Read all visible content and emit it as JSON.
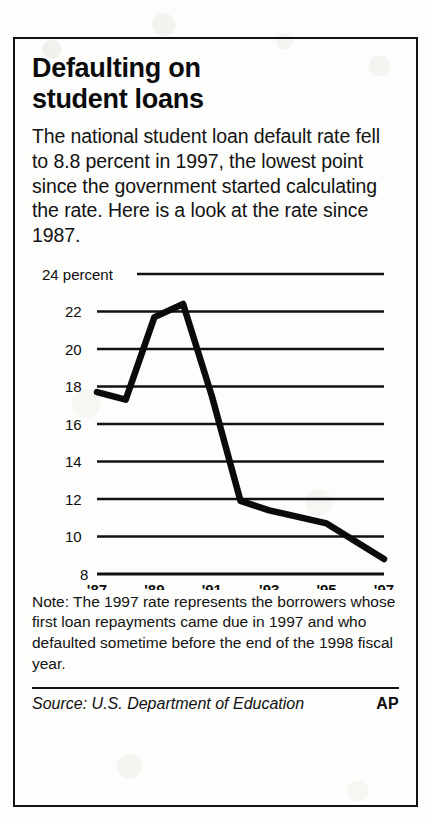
{
  "headline": {
    "line1": "Defaulting on",
    "line2": "student loans"
  },
  "deck": "The national student loan default rate fell to 8.8 percent in 1997, the lowest point since the government started calculating the rate. Here is a look at the rate since 1987.",
  "note": "Note: The 1997 rate represents the borrowers whose first loan repayments came due in 1997 and who defaulted sometime before the end of the 1998 fiscal year.",
  "source": {
    "text": "Source: U.S. Department of Education",
    "credit": "AP"
  },
  "colors": {
    "ink": "#111111",
    "line": "#0b0b0b",
    "paper": "#fdfdfb"
  },
  "chart_data": {
    "type": "line",
    "title": "Defaulting on student loans",
    "xlabel": "",
    "ylabel": "percent",
    "y_unit_label": "24 percent",
    "ylim": [
      8,
      24
    ],
    "yticks": [
      24,
      22,
      20,
      18,
      16,
      14,
      12,
      10,
      8
    ],
    "ytick_labels": [
      "24 percent",
      "22",
      "20",
      "18",
      "16",
      "14",
      "12",
      "10",
      "8"
    ],
    "grid": true,
    "grid_axis": "y",
    "legend": false,
    "xlim": [
      1987,
      1997
    ],
    "xticks": [
      1987,
      1989,
      1991,
      1993,
      1995,
      1997
    ],
    "xtick_labels": [
      "'87",
      "'89",
      "'91",
      "'93",
      "'95",
      "'97"
    ],
    "x": [
      1987,
      1988,
      1989,
      1990,
      1991,
      1992,
      1993,
      1995,
      1997
    ],
    "values": [
      17.7,
      17.3,
      21.7,
      22.4,
      17.5,
      11.9,
      11.4,
      10.7,
      8.8
    ],
    "series": [
      {
        "name": "National student loan default rate",
        "values": [
          17.7,
          17.3,
          21.7,
          22.4,
          17.5,
          11.9,
          11.4,
          10.7,
          8.8
        ]
      }
    ],
    "annotations": [
      "Rate fell to 8.8 percent in 1997",
      "Lowest point since the government started calculating the rate"
    ]
  }
}
